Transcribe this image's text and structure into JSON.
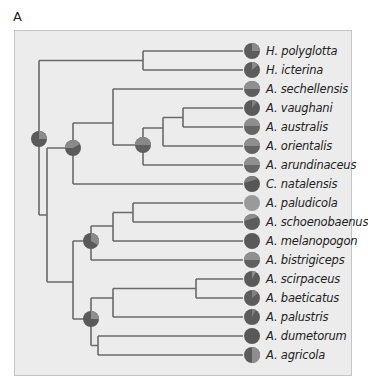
{
  "panel": {
    "label": "A"
  },
  "colors": {
    "background": "#ececec",
    "branch": "#666666",
    "state_dark": "#5a5a5a",
    "state_mid": "#7d7d7d",
    "state_light": "#9a9a9a"
  },
  "tips": [
    {
      "name": "H. polyglotta",
      "y": 51
    },
    {
      "name": "H. icterina",
      "y": 70
    },
    {
      "name": "A. sechellensis",
      "y": 89
    },
    {
      "name": "A. vaughani",
      "y": 108
    },
    {
      "name": "A. australis",
      "y": 127
    },
    {
      "name": "A. orientalis",
      "y": 146
    },
    {
      "name": "A. arundinaceus",
      "y": 165
    },
    {
      "name": "C. natalensis",
      "y": 184
    },
    {
      "name": "A. paludicola",
      "y": 203
    },
    {
      "name": "A. schoenobaenus",
      "y": 222
    },
    {
      "name": "A. melanopogon",
      "y": 241
    },
    {
      "name": "A. bistrigiceps",
      "y": 260
    },
    {
      "name": "A. scirpaceus",
      "y": 279
    },
    {
      "name": "A. baeticatus",
      "y": 298
    },
    {
      "name": "A. palustris",
      "y": 317
    },
    {
      "name": "A. dumetorum",
      "y": 336
    },
    {
      "name": "A. agricola",
      "y": 355
    }
  ]
}
